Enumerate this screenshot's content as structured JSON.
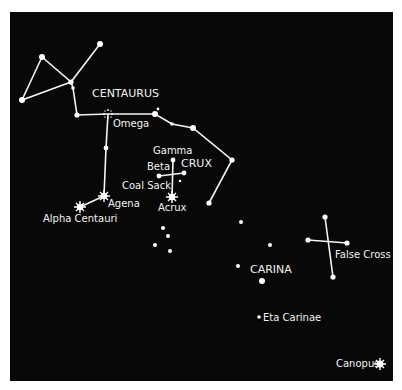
{
  "map": {
    "title": "Southern sky: Centaurus, Crux and Carina",
    "colors": {
      "background": "#080808",
      "foreground": "#f4f4f4",
      "page": "#ffffff"
    },
    "constellations": [
      {
        "name": "CENTAURUS",
        "label": "CENTAURUS"
      },
      {
        "name": "CRUX",
        "label": "CRUX"
      },
      {
        "name": "CARINA",
        "label": "CARINA"
      }
    ],
    "labels": {
      "centaurus": "CENTAURUS",
      "omega": "Omega",
      "gamma": "Gamma",
      "beta": "Beta",
      "crux": "CRUX",
      "coal_sack": "Coal Sack",
      "acrux": "Acrux",
      "agena": "Agena",
      "alpha_centauri": "Alpha Centauri",
      "carina": "CARINA",
      "false_cross": "False Cross",
      "eta_carinae": "Eta Carinae",
      "canopus": "Canopus"
    },
    "named_objects": [
      "Omega",
      "Gamma",
      "Beta",
      "Coal Sack",
      "Acrux",
      "Agena",
      "Alpha Centauri",
      "False Cross",
      "Eta Carinae",
      "Canopus"
    ]
  }
}
